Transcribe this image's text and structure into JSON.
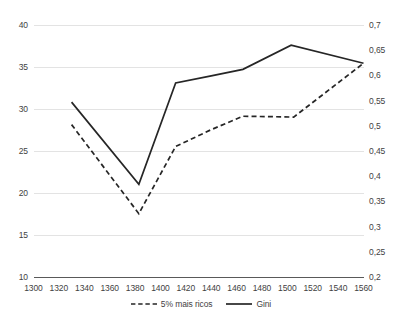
{
  "chart_data": {
    "type": "line",
    "title": "",
    "subtitle": "",
    "xlabel": "",
    "ylabel": "",
    "grid": true,
    "legend_position": "bottom",
    "x": [
      1300,
      1320,
      1340,
      1360,
      1380,
      1400,
      1420,
      1440,
      1460,
      1480,
      1500,
      1520,
      1540,
      1560
    ],
    "xlim": [
      1300,
      1560
    ],
    "xticks": [
      "1300",
      "1320",
      "1340",
      "1360",
      "1380",
      "1400",
      "1420",
      "1440",
      "1460",
      "1480",
      "1500",
      "1520",
      "1540",
      "1560"
    ],
    "axes": [
      {
        "name": "left",
        "ylim": [
          10,
          40
        ],
        "yticks": [
          "10",
          "15",
          "20",
          "25",
          "30",
          "35",
          "40"
        ],
        "ytick_values": [
          10,
          15,
          20,
          25,
          30,
          35,
          40
        ]
      },
      {
        "name": "right",
        "ylim": [
          0.2,
          0.7
        ],
        "yticks": [
          "0,2",
          "0,25",
          "0,3",
          "0,35",
          "0,4",
          "0,45",
          "0,5",
          "0,55",
          "0,6",
          "0,65",
          "0,7"
        ],
        "ytick_values": [
          0.2,
          0.25,
          0.3,
          0.35,
          0.4,
          0.45,
          0.5,
          0.55,
          0.6,
          0.65,
          0.7
        ]
      }
    ],
    "series": [
      {
        "name": "5% mais ricos",
        "axis": "left",
        "style": "dashed",
        "color": "#262626",
        "points": [
          {
            "x": 1330,
            "y": 28.2
          },
          {
            "x": 1383,
            "y": 17.6
          },
          {
            "x": 1412,
            "y": 25.6
          },
          {
            "x": 1440,
            "y": 27.6
          },
          {
            "x": 1465,
            "y": 29.2
          },
          {
            "x": 1505,
            "y": 29.1
          },
          {
            "x": 1560,
            "y": 35.5
          }
        ]
      },
      {
        "name": "Gini",
        "axis": "right",
        "style": "solid",
        "color": "#262626",
        "points": [
          {
            "x": 1330,
            "y": 0.548
          },
          {
            "x": 1383,
            "y": 0.385
          },
          {
            "x": 1412,
            "y": 0.586
          },
          {
            "x": 1440,
            "y": 0.6
          },
          {
            "x": 1465,
            "y": 0.613
          },
          {
            "x": 1503,
            "y": 0.661
          },
          {
            "x": 1560,
            "y": 0.625
          }
        ]
      }
    ],
    "colors": {
      "line": "#262626",
      "grid": "#e3e3e3",
      "axis_line": "#595959",
      "text": "#3f3f3f",
      "background": "#ffffff"
    },
    "legend": [
      {
        "label": "5% mais ricos",
        "style": "dashed"
      },
      {
        "label": "Gini",
        "style": "solid"
      }
    ]
  }
}
